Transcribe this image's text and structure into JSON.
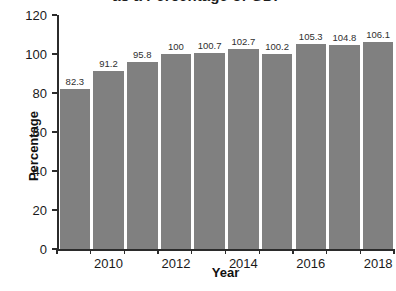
{
  "chart_data": {
    "type": "bar",
    "title": "as a Percentage of GDP",
    "xlabel": "Year",
    "ylabel": "Percentage",
    "categories": [
      "2009",
      "2010",
      "2011",
      "2012",
      "2013",
      "2014",
      "2015",
      "2016",
      "2017",
      "2018"
    ],
    "values": [
      82.3,
      91.2,
      95.8,
      100,
      100.7,
      102.7,
      100.2,
      105.3,
      104.8,
      106.1
    ],
    "data_labels": [
      "82.3",
      "91.2",
      "95.8",
      "100",
      "100.7",
      "102.7",
      "100.2",
      "105.3",
      "104.8",
      "106.1"
    ],
    "ylim": [
      0,
      120
    ],
    "ytick_values": [
      0,
      20,
      40,
      60,
      80,
      100,
      120
    ],
    "ytick_labels": [
      "0",
      "20",
      "40",
      "60",
      "80",
      "100",
      "120"
    ],
    "xtick_labels": [
      "2010",
      "2012",
      "2014",
      "2016",
      "2018"
    ],
    "xtick_categories": [
      "2010",
      "2012",
      "2014",
      "2016",
      "2018"
    ],
    "grid": false,
    "legend": false,
    "bar_color": "#808080",
    "axis_color": "#2b2b2b",
    "text_color": "#1a1a1a"
  }
}
